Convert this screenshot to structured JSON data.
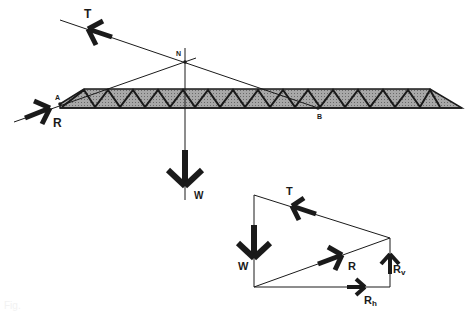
{
  "figure": {
    "space_diagram": {
      "points": {
        "A": "A",
        "B": "B",
        "N": "N"
      },
      "forces": {
        "tension": "T",
        "reaction": "R",
        "weight": "W"
      },
      "truss_fill_color": "#9a9a9a",
      "line_color": "#1a1a1a"
    },
    "force_polygon": {
      "forces": {
        "tension": "T",
        "reaction": "R",
        "weight": "W",
        "reaction_vertical": "R",
        "reaction_vertical_sub": "v",
        "reaction_horizontal": "R",
        "reaction_horizontal_sub": "h"
      }
    },
    "caption": "Fig."
  }
}
